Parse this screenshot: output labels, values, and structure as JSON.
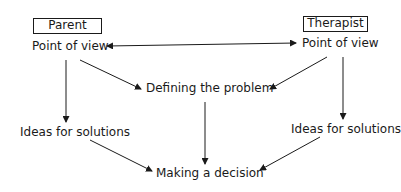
{
  "diagram": {
    "roles": {
      "parent": "Parent",
      "therapist": "Therapist"
    },
    "nodes": {
      "parent_pov": "Point of view",
      "therapist_pov": "Point of view",
      "defining": "Defining the problem",
      "parent_ideas": "Ideas for solutions",
      "therapist_ideas": "Ideas for solutions",
      "decision": "Making a decision"
    },
    "edges": [
      {
        "from": "parent_pov",
        "to": "therapist_pov",
        "bidirectional": true
      },
      {
        "from": "parent_pov",
        "to": "defining"
      },
      {
        "from": "therapist_pov",
        "to": "defining"
      },
      {
        "from": "parent_pov",
        "to": "parent_ideas"
      },
      {
        "from": "therapist_pov",
        "to": "therapist_ideas"
      },
      {
        "from": "defining",
        "to": "decision"
      },
      {
        "from": "parent_ideas",
        "to": "decision"
      },
      {
        "from": "therapist_ideas",
        "to": "decision"
      }
    ],
    "colors": {
      "line": "#1a1a1a",
      "background": "#ffffff"
    }
  }
}
